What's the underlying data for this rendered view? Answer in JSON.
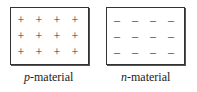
{
  "diagram": {
    "p_material": {
      "label_prefix": "p",
      "label_suffix": "-material",
      "symbol": "+",
      "rows": 3,
      "cols": 4
    },
    "n_material": {
      "label_prefix": "n",
      "label_suffix": "-material",
      "symbol": "–",
      "rows": 3,
      "cols": 4
    }
  }
}
